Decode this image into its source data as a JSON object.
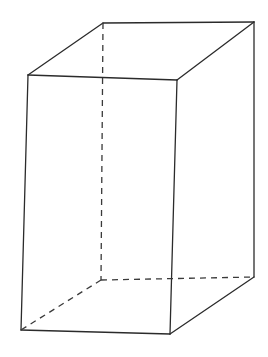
{
  "diagram": {
    "type": "rectangular-prism-wireframe",
    "stroke_color": "#2b2b2b",
    "background": "#ffffff",
    "vertices": {
      "top_front_left": [
        28,
        75
      ],
      "top_front_right": [
        177,
        80
      ],
      "top_back_left": [
        103,
        23
      ],
      "top_back_right": [
        254,
        22
      ],
      "bottom_front_left": [
        21,
        330
      ],
      "bottom_front_right": [
        170,
        334
      ],
      "bottom_back_left": [
        101,
        280
      ],
      "bottom_back_right": [
        254,
        277
      ]
    },
    "solid_edges": [
      [
        "top_front_left",
        "top_front_right"
      ],
      [
        "top_front_left",
        "top_back_left"
      ],
      [
        "top_back_left",
        "top_back_right"
      ],
      [
        "top_front_right",
        "top_back_right"
      ],
      [
        "top_front_left",
        "bottom_front_left"
      ],
      [
        "top_front_right",
        "bottom_front_right"
      ],
      [
        "top_back_right",
        "bottom_back_right"
      ],
      [
        "bottom_front_left",
        "bottom_front_right"
      ],
      [
        "bottom_front_right",
        "bottom_back_right"
      ]
    ],
    "hidden_edges": [
      [
        "top_back_left",
        "bottom_back_left"
      ],
      [
        "bottom_back_left",
        "bottom_front_left"
      ],
      [
        "bottom_back_left",
        "bottom_back_right"
      ]
    ]
  }
}
